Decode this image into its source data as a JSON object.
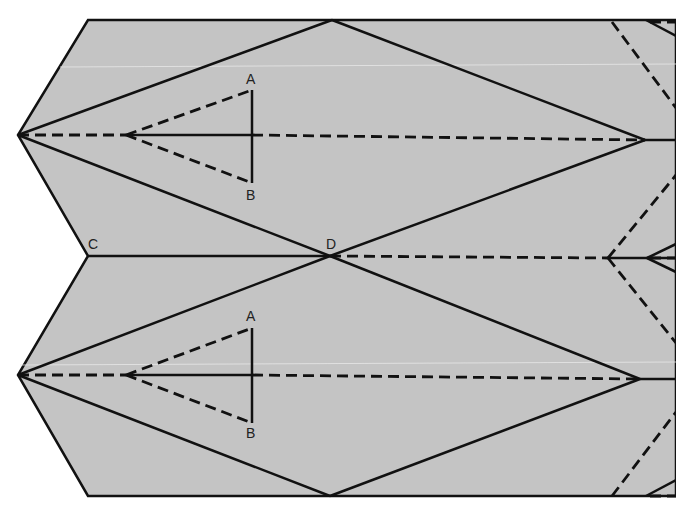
{
  "diagram": {
    "colors": {
      "paper": "#c4c4c4",
      "line": "#111111",
      "background": "#ffffff"
    },
    "labels": [
      {
        "id": "A1",
        "text": "A",
        "x": 246,
        "y": 84
      },
      {
        "id": "B1",
        "text": "B",
        "x": 246,
        "y": 200
      },
      {
        "id": "C",
        "text": "C",
        "x": 88,
        "y": 249
      },
      {
        "id": "D",
        "text": "D",
        "x": 326,
        "y": 249
      },
      {
        "id": "A2",
        "text": "A",
        "x": 246,
        "y": 321
      },
      {
        "id": "B2",
        "text": "B",
        "x": 246,
        "y": 438
      }
    ],
    "outline_points": "88,20 676,20 676,496 88,496 18,375 88,256 18,135",
    "middle_edge": {
      "x1": 88,
      "y1": 256,
      "x2": 330,
      "y2": 256
    },
    "solid_lines": [
      [
        18,
        135,
        332,
        20
      ],
      [
        332,
        20,
        645,
        140
      ],
      [
        18,
        135,
        330,
        256
      ],
      [
        330,
        256,
        645,
        140
      ],
      [
        645,
        140,
        676,
        140
      ],
      [
        18,
        375,
        330,
        256
      ],
      [
        330,
        256,
        640,
        379
      ],
      [
        18,
        375,
        330,
        496
      ],
      [
        330,
        496,
        640,
        379
      ],
      [
        640,
        379,
        676,
        379
      ],
      [
        126,
        135,
        252,
        135
      ],
      [
        252,
        90,
        252,
        183
      ],
      [
        126,
        375,
        252,
        375
      ],
      [
        252,
        328,
        252,
        423
      ],
      [
        608,
        258,
        676,
        258
      ],
      [
        647,
        258,
        676,
        244
      ],
      [
        647,
        258,
        676,
        272
      ],
      [
        646,
        20,
        676,
        36
      ],
      [
        646,
        496,
        676,
        480
      ]
    ],
    "dashed_lines": [
      [
        18,
        135,
        126,
        135
      ],
      [
        126,
        135,
        252,
        90
      ],
      [
        126,
        135,
        252,
        183
      ],
      [
        252,
        135,
        645,
        140
      ],
      [
        18,
        375,
        126,
        375
      ],
      [
        126,
        375,
        252,
        328
      ],
      [
        126,
        375,
        252,
        423
      ],
      [
        252,
        375,
        640,
        379
      ],
      [
        330,
        256,
        608,
        258
      ],
      [
        612,
        22,
        676,
        108
      ],
      [
        608,
        258,
        676,
        175
      ],
      [
        608,
        258,
        676,
        343
      ],
      [
        612,
        496,
        676,
        412
      ],
      [
        650,
        22,
        676,
        22
      ],
      [
        650,
        258,
        676,
        258
      ],
      [
        650,
        496,
        676,
        496
      ]
    ]
  }
}
